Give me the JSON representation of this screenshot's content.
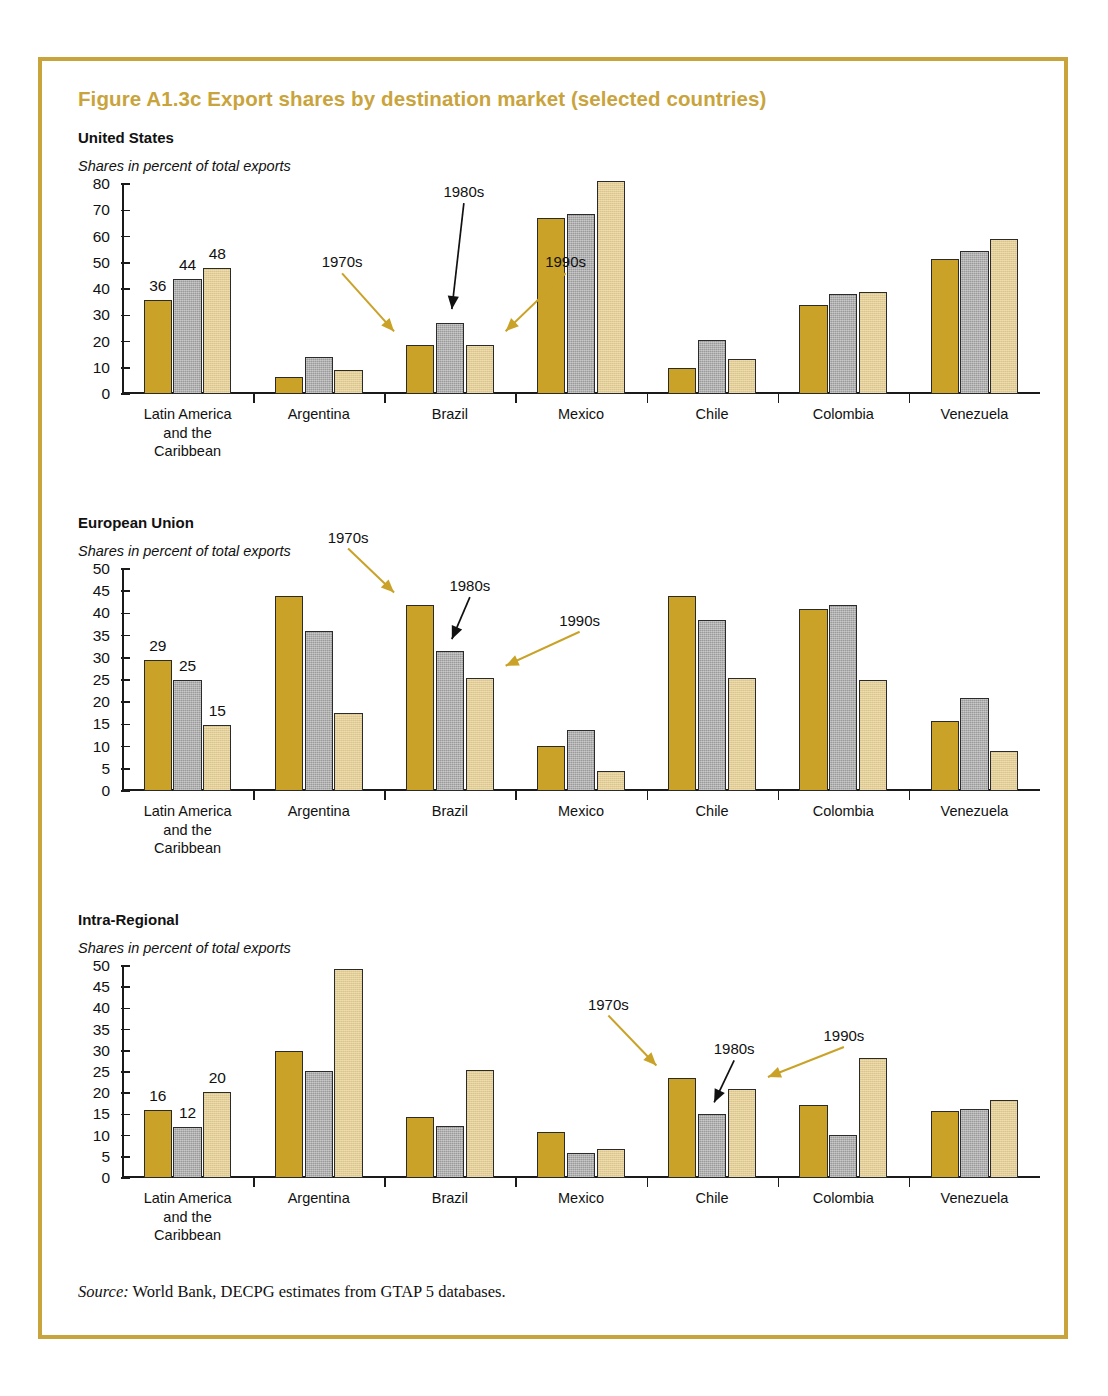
{
  "figure": {
    "title": "Figure A1.3c  Export shares by destination market (selected countries)",
    "source_prefix": "Source:",
    "source_text": " World Bank, DECPG estimates from GTAP 5 databases."
  },
  "colors": {
    "frame": "#c9a43c",
    "title": "#c9a43c",
    "series_1970s": "#c9a227",
    "series_1980s": "#9a9a9a",
    "series_1990s": "#e3cd92",
    "arrow_gold": "#c9a227",
    "arrow_black": "#111111",
    "axis": "#1a1a1a"
  },
  "annotations": {
    "label_1970s": "1970s",
    "label_1980s": "1980s",
    "label_1990s": "1990s"
  },
  "chart_data": [
    {
      "type": "bar",
      "title": "United States",
      "subtitle": "Shares in percent of total exports",
      "xlabel": "",
      "ylabel": "",
      "ylim": [
        0,
        80
      ],
      "yticks": [
        0,
        10,
        20,
        30,
        40,
        50,
        60,
        70,
        80
      ],
      "grid": false,
      "legend": "annotated arrows",
      "categories": [
        "Latin America\nand the\nCaribbean",
        "Argentina",
        "Brazil",
        "Mexico",
        "Chile",
        "Colombia",
        "Venezuela"
      ],
      "series": [
        {
          "name": "1970s",
          "values": [
            36,
            6.5,
            18.5,
            67,
            10,
            34,
            51.5
          ]
        },
        {
          "name": "1980s",
          "values": [
            44,
            14,
            27,
            68.5,
            20.5,
            38,
            54.5
          ]
        },
        {
          "name": "1990s",
          "values": [
            48,
            9.3,
            18.6,
            81,
            13.2,
            39,
            59
          ]
        }
      ],
      "data_labels": {
        "group": 0,
        "values": [
          "36",
          "44",
          "48"
        ]
      }
    },
    {
      "type": "bar",
      "title": "European Union",
      "subtitle": "Shares in percent of total exports",
      "xlabel": "",
      "ylabel": "",
      "ylim": [
        0,
        50
      ],
      "yticks": [
        0,
        5,
        10,
        15,
        20,
        25,
        30,
        35,
        40,
        45,
        50
      ],
      "grid": false,
      "legend": "annotated arrows",
      "categories": [
        "Latin America\nand the\nCaribbean",
        "Argentina",
        "Brazil",
        "Mexico",
        "Chile",
        "Colombia",
        "Venezuela"
      ],
      "series": [
        {
          "name": "1970s",
          "values": [
            29.5,
            44,
            42,
            10.2,
            44,
            41,
            15.8
          ]
        },
        {
          "name": "1980s",
          "values": [
            25,
            36,
            31.5,
            13.7,
            38.5,
            42,
            21
          ]
        },
        {
          "name": "1990s",
          "values": [
            14.8,
            17.5,
            25.5,
            4.5,
            25.5,
            25,
            9
          ]
        }
      ],
      "data_labels": {
        "group": 0,
        "values": [
          "29",
          "25",
          "15"
        ]
      }
    },
    {
      "type": "bar",
      "title": "Intra-Regional",
      "subtitle": "Shares in percent of total exports",
      "xlabel": "",
      "ylabel": "",
      "ylim": [
        0,
        50
      ],
      "yticks": [
        0,
        5,
        10,
        15,
        20,
        25,
        30,
        35,
        40,
        45,
        50
      ],
      "grid": false,
      "legend": "annotated arrows",
      "categories": [
        "Latin America\nand the\nCaribbean",
        "Argentina",
        "Brazil",
        "Mexico",
        "Chile",
        "Colombia",
        "Venezuela"
      ],
      "series": [
        {
          "name": "1970s",
          "values": [
            16,
            30,
            14.5,
            10.8,
            23.7,
            17.2,
            15.9
          ]
        },
        {
          "name": "1980s",
          "values": [
            12,
            25.3,
            12.2,
            6,
            15,
            10.2,
            16.3
          ]
        },
        {
          "name": "1990s",
          "values": [
            20.3,
            49.3,
            25.4,
            6.8,
            21,
            28.4,
            18.3
          ]
        }
      ],
      "data_labels": {
        "group": 0,
        "values": [
          "16",
          "12",
          "20"
        ]
      }
    }
  ]
}
